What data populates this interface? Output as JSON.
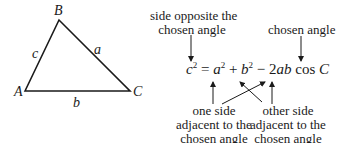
{
  "triangle": {
    "vertices": [
      {
        "name": "A",
        "x": 25,
        "y": 91
      },
      {
        "name": "B",
        "x": 59,
        "y": 20
      },
      {
        "name": "C",
        "x": 130,
        "y": 91
      }
    ],
    "sides": [
      {
        "name": "a",
        "between": "B-C"
      },
      {
        "name": "b",
        "between": "A-C"
      },
      {
        "name": "c",
        "between": "A-B"
      }
    ]
  },
  "formula": {
    "lhs": "c",
    "a": "a",
    "b": "b",
    "plus": "+",
    "minus": "−",
    "equals": "=",
    "coef": "2",
    "ab": "ab",
    "cos": "cos",
    "angle": "C",
    "exp": "2"
  },
  "annotations": {
    "opposite_line1": "side opposite the",
    "opposite_line2": "chosen angle",
    "chosen_angle": "chosen angle",
    "one_side_line1": "one side",
    "one_side_line2": "adjacent to the",
    "one_side_line3": "chosen angle",
    "other_side_line1": "other side",
    "other_side_line2": "adjacent to the",
    "other_side_line3": "chosen angle"
  },
  "colors": {
    "stroke": "#1a1a1a",
    "background": "#ffffff"
  }
}
